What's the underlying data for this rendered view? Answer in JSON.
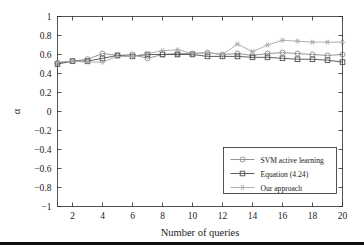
{
  "figure": {
    "background_color": "#ffffff",
    "rule_color": "#111111"
  },
  "chart_data": {
    "type": "line",
    "title": "",
    "xlabel": "Number of queries",
    "ylabel": "α",
    "xlim": [
      1,
      20
    ],
    "ylim": [
      -1,
      1
    ],
    "xticks": [
      2,
      4,
      6,
      8,
      10,
      12,
      14,
      16,
      18,
      20
    ],
    "xtick_labels": [
      "2",
      "4",
      "6",
      "8",
      "10",
      "12",
      "14",
      "16",
      "18",
      "20"
    ],
    "yticks": [
      -1,
      -0.8,
      -0.6,
      -0.4,
      -0.2,
      0,
      0.2,
      0.4,
      0.6,
      0.8,
      1
    ],
    "ytick_labels": [
      "−1",
      "−0.8",
      "−0.6",
      "−0.4",
      "−0.2",
      "0",
      "0.2",
      "0.4",
      "0.6",
      "0.8",
      "1"
    ],
    "grid": false,
    "legend_position": "lower right",
    "x": [
      1,
      2,
      3,
      4,
      5,
      6,
      7,
      8,
      9,
      10,
      11,
      12,
      13,
      14,
      15,
      16,
      17,
      18,
      19,
      20
    ],
    "series": [
      {
        "name": "SVM active learning",
        "marker": "circle",
        "color": "#8a8a8a",
        "values": [
          0.51,
          0.53,
          0.55,
          0.61,
          0.59,
          0.6,
          0.56,
          0.6,
          0.61,
          0.61,
          0.62,
          0.6,
          0.61,
          0.59,
          0.61,
          0.62,
          0.61,
          0.6,
          0.59,
          0.6
        ]
      },
      {
        "name": "Equation (4.24)",
        "marker": "square",
        "color": "#4d4d4d",
        "values": [
          0.5,
          0.53,
          0.53,
          0.56,
          0.59,
          0.58,
          0.6,
          0.6,
          0.6,
          0.6,
          0.58,
          0.58,
          0.58,
          0.57,
          0.57,
          0.56,
          0.55,
          0.55,
          0.54,
          0.52
        ]
      },
      {
        "name": "Our approach",
        "marker": "star",
        "color": "#a8a8a8",
        "values": [
          0.52,
          0.53,
          0.52,
          0.52,
          0.58,
          0.58,
          0.61,
          0.64,
          0.65,
          0.61,
          0.62,
          0.6,
          0.71,
          0.63,
          0.7,
          0.75,
          0.74,
          0.73,
          0.73,
          0.73
        ]
      }
    ]
  }
}
